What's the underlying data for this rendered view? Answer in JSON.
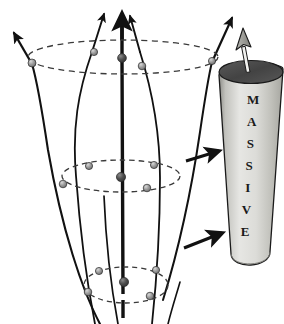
{
  "figure": {
    "background_color": "#ffffff",
    "width": 284,
    "height": 324
  },
  "cylinder": {
    "label_text": "MASSIVE",
    "letters": [
      "M",
      "A",
      "S",
      "S",
      "I",
      "V",
      "E"
    ],
    "body_color_light": "#e8e8e6",
    "body_color_mid": "#c9c9c4",
    "body_color_dark": "#9a9a95",
    "top_cap_color": "#4a4a4a",
    "outline_color": "#1a1a1a",
    "axis_arrow_fill": "#9e9e99",
    "axis_arrow_outline": "#1a1a1a",
    "letter_font_size": "13px"
  },
  "flux_tube": {
    "axis_color": "#111111",
    "field_line_color": "#111111",
    "ellipse_color": "#3a3a3a",
    "ellipse_style": "dashed",
    "node_fill": "#8d8d8d",
    "node_fill_dark": "#4a4a4a",
    "node_outline": "#1a1a1a",
    "cross_sections": [
      {
        "name": "top-cross-section",
        "cx": 123,
        "cy": 57,
        "rx": 95,
        "ry": 17
      },
      {
        "name": "middle-cross-section",
        "cx": 121,
        "cy": 176,
        "rx": 59,
        "ry": 16
      },
      {
        "name": "bottom-cross-section",
        "cx": 126,
        "cy": 285,
        "rx": 42,
        "ry": 18
      }
    ],
    "arrowhead_count_top": 3
  },
  "force_arrows": {
    "upper": {
      "name": "upper-force-arrow",
      "direction": "up-right"
    },
    "lower": {
      "name": "lower-force-arrow",
      "direction": "up-right"
    }
  }
}
